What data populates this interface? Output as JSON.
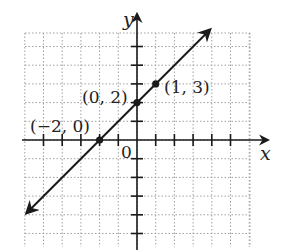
{
  "chart_data": {
    "type": "line",
    "title": "",
    "xlabel": "x",
    "ylabel": "y",
    "origin_label": "0",
    "xlim": [
      -4,
      4
    ],
    "ylim": [
      -4,
      4
    ],
    "grid": true,
    "grid_style": "dotted",
    "series": [
      {
        "name": "line",
        "equation": "y = x + 2",
        "x": [
          -2,
          0,
          1
        ],
        "y": [
          0,
          2,
          3
        ],
        "arrows": "both"
      }
    ],
    "points": [
      {
        "label": "(−2, 0)",
        "x": -2,
        "y": 0
      },
      {
        "label": "(0, 2)",
        "x": 0,
        "y": 2
      },
      {
        "label": "(1, 3)",
        "x": 1,
        "y": 3
      }
    ]
  },
  "labels": {
    "x_axis": "x",
    "y_axis": "y",
    "origin": "0",
    "p1": "(−2, 0)",
    "p2": "(0, 2)",
    "p3": "(1, 3)"
  },
  "colors": {
    "ink": "#1a1a1a",
    "grid": "#9a9a9a"
  }
}
